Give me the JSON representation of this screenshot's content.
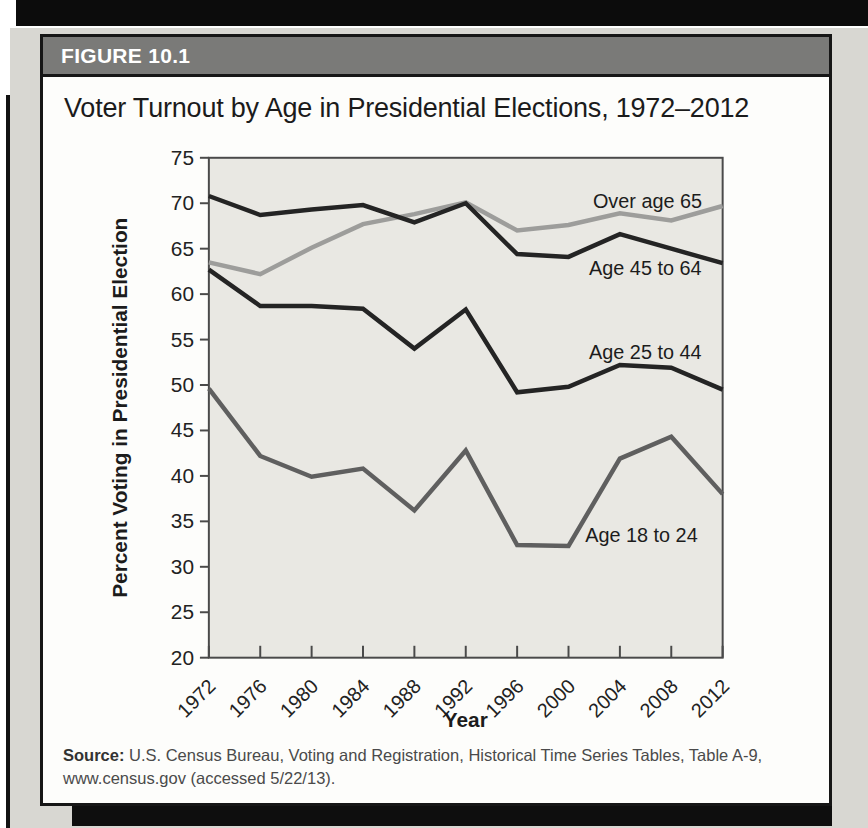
{
  "figure": {
    "header_label": "FIGURE 10.1",
    "title": "Voter Turnout by Age in Presidential Elections, 1972–2012",
    "source_prefix": "Source:",
    "source_text": " U.S. Census Bureau, Voting and Registration, Historical Time Series Tables, Table A-9, www.census.gov (accessed 5/22/13)."
  },
  "colors": {
    "top_band": "#0c0c0c",
    "page_bg": "#d8d7d2",
    "card_bg": "#fdfdfb",
    "card_border": "#161616",
    "header_bar": "#7a7a78",
    "header_text": "#ffffff",
    "plot_bg": "#e9e8e3",
    "axis": "#4a4a4a",
    "tick_text": "#222222",
    "annotation_text": "#1c1c1c",
    "source_text": "#4a4a4a"
  },
  "chart_data": {
    "type": "line",
    "title": "Voter Turnout by Age in Presidential Elections, 1972–2012",
    "xlabel": "Year",
    "ylabel": "Percent Voting in Presidential Election",
    "x": [
      1972,
      1976,
      1980,
      1984,
      1988,
      1992,
      1996,
      2000,
      2004,
      2008,
      2012
    ],
    "ylim": [
      20,
      75
    ],
    "ytick_step": 5,
    "grid": false,
    "legend_position": "inline-annotations",
    "series": [
      {
        "name": "Over age 65",
        "color": "#9d9d9b",
        "values": [
          63.5,
          62.2,
          65.1,
          67.7,
          68.8,
          70.1,
          67.0,
          67.6,
          68.9,
          68.1,
          69.7
        ],
        "label_anchor": {
          "year": 2001.9,
          "value": 69.5
        }
      },
      {
        "name": "Age 45 to 64",
        "color": "#242424",
        "values": [
          70.8,
          68.7,
          69.3,
          69.8,
          67.9,
          70.0,
          64.4,
          64.1,
          66.6,
          65.0,
          63.4
        ],
        "label_anchor": {
          "year": 2001.6,
          "value": 62.1
        }
      },
      {
        "name": "Age 25 to 44",
        "color": "#242424",
        "values": [
          62.7,
          58.7,
          58.7,
          58.4,
          54.0,
          58.3,
          49.2,
          49.8,
          52.2,
          51.9,
          49.5
        ],
        "label_anchor": {
          "year": 2001.6,
          "value": 52.9
        }
      },
      {
        "name": "Age 18 to 24",
        "color": "#5f5f5f",
        "values": [
          49.6,
          42.2,
          39.9,
          40.8,
          36.2,
          42.8,
          32.4,
          32.3,
          41.9,
          44.3,
          38.0
        ],
        "label_anchor": {
          "year": 2001.3,
          "value": 32.7
        }
      }
    ]
  }
}
